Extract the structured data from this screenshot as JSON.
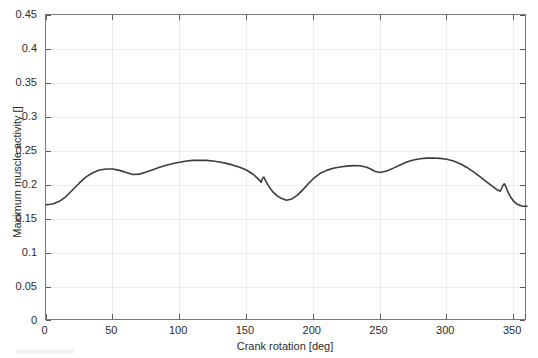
{
  "figure": {
    "background_color": "#ffffff",
    "axis_color": "#7a7a7a",
    "grid_color": "#ececec",
    "curve_color": "#3c3c3c"
  },
  "axis": {
    "x_title": "Crank rotation [deg]",
    "y_title": "Maximum muscle activity []",
    "x_ticks": [
      "0",
      "50",
      "100",
      "150",
      "200",
      "250",
      "300",
      "350"
    ],
    "y_ticks": [
      "0",
      "0.05",
      "0.1",
      "0.15",
      "0.2",
      "0.25",
      "0.3",
      "0.35",
      "0.4",
      "0.45"
    ]
  },
  "chart_data": {
    "type": "line",
    "title": "",
    "xlabel": "Crank rotation [deg]",
    "ylabel": "Maximum muscle activity []",
    "xlim": [
      0,
      360
    ],
    "ylim": [
      0,
      0.45
    ],
    "xticks": [
      0,
      50,
      100,
      150,
      200,
      250,
      300,
      350
    ],
    "yticks": [
      0,
      0.05,
      0.1,
      0.15,
      0.2,
      0.25,
      0.3,
      0.35,
      0.4,
      0.45
    ],
    "grid": true,
    "legend": null,
    "series": [
      {
        "name": "Maximum muscle activity",
        "x": [
          0,
          5,
          10,
          15,
          20,
          25,
          30,
          35,
          40,
          45,
          50,
          55,
          60,
          65,
          70,
          75,
          80,
          85,
          90,
          95,
          100,
          105,
          110,
          115,
          120,
          125,
          130,
          135,
          140,
          145,
          150,
          155,
          158,
          160,
          161,
          162,
          163,
          164,
          166,
          168,
          170,
          173,
          176,
          180,
          184,
          188,
          192,
          196,
          200,
          205,
          210,
          215,
          220,
          225,
          230,
          235,
          240,
          243,
          246,
          250,
          255,
          260,
          265,
          270,
          275,
          280,
          285,
          290,
          295,
          300,
          305,
          310,
          315,
          320,
          325,
          330,
          335,
          338,
          340,
          341,
          342,
          343,
          344,
          345,
          346,
          348,
          350,
          352,
          355,
          357,
          360
        ],
        "y": [
          0.171,
          0.172,
          0.176,
          0.183,
          0.193,
          0.203,
          0.212,
          0.218,
          0.222,
          0.2235,
          0.2235,
          0.2215,
          0.2185,
          0.2155,
          0.216,
          0.219,
          0.2225,
          0.226,
          0.229,
          0.2315,
          0.2335,
          0.2352,
          0.2362,
          0.2365,
          0.2362,
          0.2352,
          0.2338,
          0.2318,
          0.2292,
          0.226,
          0.222,
          0.2158,
          0.2105,
          0.2065,
          0.204,
          0.2095,
          0.2118,
          0.2075,
          0.2005,
          0.1945,
          0.1895,
          0.184,
          0.1805,
          0.1775,
          0.1795,
          0.1848,
          0.1925,
          0.2012,
          0.2092,
          0.2168,
          0.2215,
          0.2245,
          0.2265,
          0.2278,
          0.2285,
          0.2282,
          0.2262,
          0.2235,
          0.2202,
          0.2185,
          0.2205,
          0.2248,
          0.2295,
          0.2338,
          0.2368,
          0.2385,
          0.2395,
          0.2398,
          0.2392,
          0.2378,
          0.2352,
          0.2312,
          0.2258,
          0.2192,
          0.2118,
          0.2042,
          0.1968,
          0.1925,
          0.1908,
          0.1948,
          0.1995,
          0.2018,
          0.1985,
          0.1935,
          0.1888,
          0.1815,
          0.1762,
          0.1725,
          0.1698,
          0.1688,
          0.1688
        ]
      }
    ]
  }
}
